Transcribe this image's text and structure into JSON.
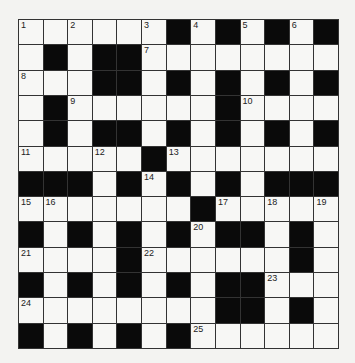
{
  "puzzle": {
    "rows": 13,
    "cols": 13,
    "colors": {
      "black": "#0a0a0a",
      "white": "#f7f7f5",
      "line": "#333333"
    },
    "layout": [
      "WWWWWWBWBWBWB",
      "WBWBBWWWWWWWW",
      "WWWBBWBWBWBWB",
      "WBWWWWWWBWWWW",
      "WBWBBWBWBWBWB",
      "WWWWWBWWWWWWW",
      "BBBWBWBWBWBBB",
      "WWWWWWWBWWWWW",
      "BWBWBWBWBBWBW",
      "WWWWBWWWWWWBW",
      "BWBWBWBWBBWWW",
      "WWWWWWWWBBWBW",
      "BWBWBWBWWWWWW"
    ],
    "numbers": [
      {
        "r": 0,
        "c": 0,
        "n": "1"
      },
      {
        "r": 0,
        "c": 2,
        "n": "2"
      },
      {
        "r": 0,
        "c": 5,
        "n": "3"
      },
      {
        "r": 0,
        "c": 7,
        "n": "4"
      },
      {
        "r": 0,
        "c": 9,
        "n": "5"
      },
      {
        "r": 0,
        "c": 11,
        "n": "6"
      },
      {
        "r": 1,
        "c": 5,
        "n": "7"
      },
      {
        "r": 2,
        "c": 0,
        "n": "8"
      },
      {
        "r": 3,
        "c": 2,
        "n": "9"
      },
      {
        "r": 3,
        "c": 9,
        "n": "10"
      },
      {
        "r": 5,
        "c": 0,
        "n": "11"
      },
      {
        "r": 5,
        "c": 3,
        "n": "12"
      },
      {
        "r": 5,
        "c": 6,
        "n": "13"
      },
      {
        "r": 6,
        "c": 5,
        "n": "14"
      },
      {
        "r": 7,
        "c": 0,
        "n": "15"
      },
      {
        "r": 7,
        "c": 1,
        "n": "16"
      },
      {
        "r": 7,
        "c": 8,
        "n": "17"
      },
      {
        "r": 7,
        "c": 10,
        "n": "18"
      },
      {
        "r": 7,
        "c": 12,
        "n": "19"
      },
      {
        "r": 8,
        "c": 7,
        "n": "20"
      },
      {
        "r": 9,
        "c": 0,
        "n": "21"
      },
      {
        "r": 9,
        "c": 5,
        "n": "22"
      },
      {
        "r": 10,
        "c": 10,
        "n": "23"
      },
      {
        "r": 11,
        "c": 0,
        "n": "24"
      },
      {
        "r": 12,
        "c": 7,
        "n": "25"
      }
    ]
  }
}
